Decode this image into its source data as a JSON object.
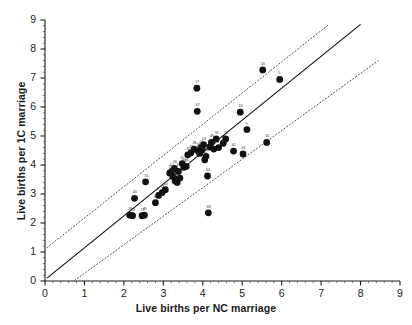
{
  "chart_data": {
    "type": "scatter",
    "title": "",
    "xlabel": "Live births per NC marriage",
    "ylabel": "Live births per 1C marriage",
    "xlim": [
      0,
      9
    ],
    "ylim": [
      0,
      9
    ],
    "xticks": [
      0,
      1,
      2,
      3,
      4,
      5,
      6,
      7,
      8,
      9
    ],
    "yticks": [
      0,
      1,
      2,
      3,
      4,
      5,
      6,
      7,
      8,
      9
    ],
    "xtick_labels": [
      "0",
      "1",
      "2",
      "3",
      "4",
      "5",
      "6",
      "7",
      "8",
      "9"
    ],
    "ytick_labels": [
      "0",
      "1",
      "2",
      "3",
      "4",
      "5",
      "6",
      "7",
      "8",
      "9"
    ],
    "minor_ticks": true,
    "grid": false,
    "legend": null,
    "marker": {
      "shape": "circle",
      "color": "#111111",
      "size": 3.4
    },
    "point_labels_shown": true,
    "points": [
      {
        "label": "26",
        "x": 2.15,
        "y": 2.27
      },
      {
        "label": "59",
        "x": 2.22,
        "y": 2.25
      },
      {
        "label": "40",
        "x": 2.27,
        "y": 2.85
      },
      {
        "label": "72",
        "x": 2.46,
        "y": 2.25
      },
      {
        "label": "45",
        "x": 2.52,
        "y": 2.27
      },
      {
        "label": "74",
        "x": 2.55,
        "y": 3.42
      },
      {
        "label": "47",
        "x": 2.8,
        "y": 2.7
      },
      {
        "label": "8",
        "x": 2.88,
        "y": 2.95
      },
      {
        "label": "13",
        "x": 2.97,
        "y": 3.05
      },
      {
        "label": "20",
        "x": 3.05,
        "y": 3.15
      },
      {
        "label": "73",
        "x": 3.16,
        "y": 3.72
      },
      {
        "label": "12",
        "x": 3.21,
        "y": 3.78
      },
      {
        "label": "57",
        "x": 3.24,
        "y": 3.6
      },
      {
        "label": "33",
        "x": 3.28,
        "y": 3.88
      },
      {
        "label": "1",
        "x": 3.3,
        "y": 3.45
      },
      {
        "label": "43",
        "x": 3.33,
        "y": 3.5
      },
      {
        "label": "60",
        "x": 3.35,
        "y": 3.4
      },
      {
        "label": "69",
        "x": 3.38,
        "y": 3.78
      },
      {
        "label": "30",
        "x": 3.42,
        "y": 3.55
      },
      {
        "label": "62",
        "x": 3.48,
        "y": 4.05
      },
      {
        "label": "21",
        "x": 3.52,
        "y": 3.92
      },
      {
        "label": "66",
        "x": 3.58,
        "y": 3.95
      },
      {
        "label": "36",
        "x": 3.62,
        "y": 4.35
      },
      {
        "label": "37",
        "x": 3.7,
        "y": 4.42
      },
      {
        "label": "38",
        "x": 3.78,
        "y": 4.55
      },
      {
        "label": "17",
        "x": 3.85,
        "y": 6.65
      },
      {
        "label": "67",
        "x": 3.86,
        "y": 5.85
      },
      {
        "label": "39",
        "x": 3.88,
        "y": 4.48
      },
      {
        "label": "65",
        "x": 3.92,
        "y": 4.4
      },
      {
        "label": "22",
        "x": 3.95,
        "y": 4.6
      },
      {
        "label": "2",
        "x": 3.98,
        "y": 4.52
      },
      {
        "label": "53",
        "x": 4.02,
        "y": 4.7
      },
      {
        "label": "29",
        "x": 4.05,
        "y": 4.18
      },
      {
        "label": "51",
        "x": 4.08,
        "y": 4.3
      },
      {
        "label": "64",
        "x": 4.12,
        "y": 3.62
      },
      {
        "label": "68",
        "x": 4.14,
        "y": 2.35
      },
      {
        "label": "4",
        "x": 4.18,
        "y": 4.62
      },
      {
        "label": "49",
        "x": 4.22,
        "y": 4.78
      },
      {
        "label": "55",
        "x": 4.28,
        "y": 4.55
      },
      {
        "label": "31",
        "x": 4.34,
        "y": 4.9
      },
      {
        "label": "3",
        "x": 4.4,
        "y": 4.6
      },
      {
        "label": "23",
        "x": 4.52,
        "y": 4.75
      },
      {
        "label": "61",
        "x": 4.78,
        "y": 4.48
      },
      {
        "label": "34",
        "x": 5.02,
        "y": 4.38
      },
      {
        "label": "9",
        "x": 5.12,
        "y": 5.22
      },
      {
        "label": "19",
        "x": 4.95,
        "y": 5.82
      },
      {
        "label": "10",
        "x": 5.52,
        "y": 7.28
      },
      {
        "label": "5",
        "x": 5.95,
        "y": 6.95
      },
      {
        "label": "35",
        "x": 5.62,
        "y": 4.78
      },
      {
        "label": "16",
        "x": 4.58,
        "y": 4.9
      }
    ],
    "fit_line": {
      "style": "solid",
      "color": "#111111",
      "x0": 0.05,
      "y0": 0.1,
      "x1": 8.0,
      "y1": 8.85
    },
    "confidence_bands": [
      {
        "name": "upper-band",
        "style": "dotted",
        "color": "#555555",
        "x0": 0.05,
        "y0": 1.15,
        "x1": 7.2,
        "y1": 8.85
      },
      {
        "name": "lower-band",
        "style": "dotted",
        "color": "#555555",
        "x0": 0.75,
        "y0": 0.02,
        "x1": 8.45,
        "y1": 7.6
      }
    ]
  }
}
